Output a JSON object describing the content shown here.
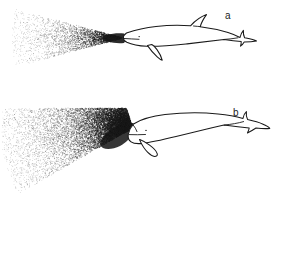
{
  "figure": {
    "background_color": "#ffffff",
    "ink_color": "#1a1a1a",
    "width": 283,
    "height": 256,
    "panels": [
      {
        "id": "a",
        "label": "a",
        "label_x": 228,
        "label_y": 19,
        "animal_name": "dolphin-with-dorsal-fin",
        "beam_name": "narrow-sound-beam",
        "beam_shape": "narrow-triangular-cone",
        "beam_apex": [
          124,
          38
        ],
        "beam_color": "#1a1a1a",
        "beam_spread_degrees": 28
      },
      {
        "id": "b",
        "label": "b",
        "label_x": 236,
        "label_y": 116,
        "animal_name": "dolphin-without-dorsal-fin",
        "beam_name": "wide-sound-beam",
        "beam_shape": "broad-fan-sector",
        "beam_apex": [
          133,
          128
        ],
        "beam_color": "#1a1a1a",
        "beam_spread_degrees": 95
      }
    ]
  },
  "stipple": {
    "seed": 20240517,
    "panel_a_points": 2600,
    "panel_b_points": 11000,
    "dot_radius_min": 0.32,
    "dot_radius_max": 0.62,
    "density_falloff": "exponential-from-apex"
  }
}
